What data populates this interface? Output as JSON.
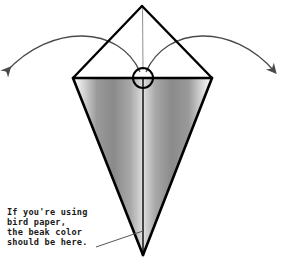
{
  "diagram": {
    "background_color": "#ffffff",
    "canvas": {
      "width": 285,
      "height": 261
    },
    "annotation": {
      "name": "beak-color-note",
      "lines": [
        "If you're using",
        "bird paper,",
        "the beak color",
        "should be here."
      ],
      "text_color": "#1a1a1a",
      "leader_line_color": "#555555"
    },
    "shape": {
      "name": "kite-with-triangle",
      "outline_color": "#000000",
      "fold_line_color": "#8c8c8c",
      "center_line_color": "#111111",
      "vertices": {
        "top_apex": [
          142,
          6
        ],
        "left_corner": [
          73,
          78
        ],
        "right_corner": [
          212,
          78
        ],
        "bottom_point": [
          143,
          255
        ]
      },
      "shading": {
        "edge_color": "#ffffff",
        "mid_color": "#8a8a8a",
        "center_color": "#d8d8d8"
      }
    },
    "marker": {
      "name": "center-circle-marker",
      "center": [
        143,
        78
      ],
      "radius": 10,
      "stroke_color": "#000000"
    },
    "arrows": [
      {
        "name": "fold-arrow-left",
        "direction": "left",
        "color": "#4a4a4a",
        "start": [
          143,
          70
        ],
        "end": [
          4,
          78
        ]
      },
      {
        "name": "fold-arrow-right",
        "direction": "right",
        "color": "#4a4a4a",
        "start": [
          143,
          70
        ],
        "end": [
          277,
          78
        ]
      }
    ]
  }
}
